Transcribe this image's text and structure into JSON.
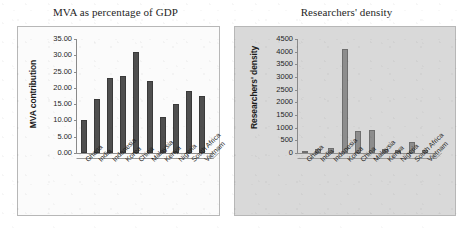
{
  "figure": {
    "panels": [
      {
        "key": "mva",
        "title": "MVA as percentage of GDP",
        "ylabel": "MVA contribution"
      },
      {
        "key": "researchers",
        "title": "Researchers' density",
        "ylabel": "Researchers' density"
      }
    ]
  },
  "chart_data": [
    {
      "type": "bar",
      "title": "MVA as percentage of GDP",
      "xlabel": "",
      "ylabel": "MVA contribution",
      "categories": [
        "Ghana",
        "India",
        "Indonesia",
        "Korea",
        "China",
        "Malaysia",
        "Kenya",
        "Nigeria",
        "South Africa",
        "Vietnam"
      ],
      "values": [
        10.0,
        16.5,
        23.0,
        23.5,
        31.0,
        22.0,
        11.0,
        15.0,
        19.0,
        17.5
      ],
      "ylim": [
        0,
        35
      ],
      "yticks": [
        "0.00",
        "5.00",
        "10.00",
        "15.00",
        "20.00",
        "25.00",
        "30.00",
        "35.00"
      ],
      "ytick_values": [
        0,
        5,
        10,
        15,
        20,
        25,
        30,
        35
      ],
      "grid": false,
      "legend": null,
      "bar_color": "#4f4f4f",
      "plot_background": "#fbfbfb"
    },
    {
      "type": "bar",
      "title": "Researchers' density",
      "xlabel": "",
      "ylabel": "Researchers' density",
      "categories": [
        "Ghana",
        "India",
        "Indonesia",
        "Korea",
        "China",
        "Malaysia",
        "Kenya",
        "Nigeria",
        "South Africa",
        "Vietnam"
      ],
      "values": [
        80,
        140,
        190,
        4100,
        850,
        900,
        160,
        100,
        420,
        130
      ],
      "ylim": [
        0,
        4500
      ],
      "yticks": [
        "0",
        "500",
        "1000",
        "1500",
        "2000",
        "2500",
        "3000",
        "3500",
        "4000",
        "4500"
      ],
      "ytick_values": [
        0,
        500,
        1000,
        1500,
        2000,
        2500,
        3000,
        3500,
        4000,
        4500
      ],
      "grid": false,
      "legend": null,
      "bar_color": "#8d8d8d",
      "plot_background": "#d9d9d9"
    }
  ]
}
